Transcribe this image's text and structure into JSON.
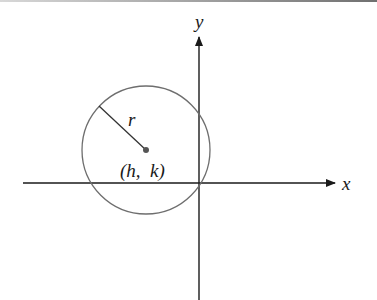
{
  "diagram": {
    "type": "circle-on-coordinate-plane",
    "labels": {
      "x_axis": "x",
      "y_axis": "y",
      "radius": "r",
      "center": "(h,  k)"
    },
    "colors": {
      "axes": "#1a1a1a",
      "circle": "#6e6e6e",
      "radius_line": "#333333",
      "center_dot": "#555555"
    },
    "geometry": {
      "origin": [
        199,
        183
      ],
      "circle_center": [
        146,
        150
      ],
      "circle_radius": 64,
      "radius_endpoint": [
        99,
        106
      ]
    }
  }
}
